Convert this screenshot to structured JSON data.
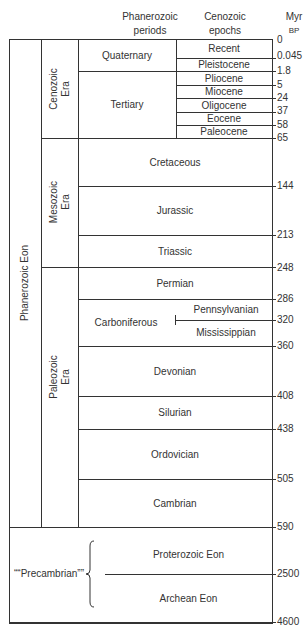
{
  "headers": {
    "periods": [
      "Phanerozoic",
      "periods"
    ],
    "epochs": [
      "Cenozoic",
      "epochs"
    ],
    "units": [
      "Myr",
      "BP"
    ]
  },
  "eons": {
    "phanerozoic": "Phanerozoic Eon",
    "precambrian": "““Precambrian””",
    "proterozoic": "Proterozoic Eon",
    "archean": "Archean Eon"
  },
  "eras": {
    "cenozoic": [
      "Cenozoic",
      "Era"
    ],
    "mesozoic": [
      "Mesozoic",
      "Era"
    ],
    "paleozoic": [
      "Paleozoic",
      "Era"
    ]
  },
  "periods": {
    "quaternary": "Quaternary",
    "tertiary": "Tertiary",
    "cretaceous": "Cretaceous",
    "jurassic": "Jurassic",
    "triassic": "Triassic",
    "permian": "Permian",
    "carboniferous": "Carboniferous",
    "devonian": "Devonian",
    "silurian": "Silurian",
    "ordovician": "Ordovician",
    "cambrian": "Cambrian"
  },
  "subperiods": {
    "pennsylvanian": "Pennsylvanian",
    "mississippian": "Mississippian"
  },
  "epochs": {
    "recent": "Recent",
    "pleistocene": "Pleistocene",
    "pliocene": "Pliocene",
    "miocene": "Miocene",
    "oligocene": "Oligocene",
    "eocene": "Eocene",
    "paleocene": "Paleocene"
  },
  "ticks": [
    "0",
    "0.045",
    "1.8",
    "5",
    "24",
    "37",
    "58",
    "65",
    "144",
    "213",
    "248",
    "286",
    "320",
    "360",
    "408",
    "438",
    "505",
    "590",
    "2500",
    "4600"
  ]
}
